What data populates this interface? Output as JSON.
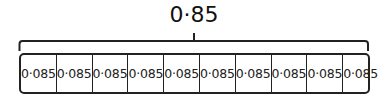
{
  "diagram": {
    "total": {
      "label": "0·85"
    },
    "parts": [
      {
        "label": "0·085"
      },
      {
        "label": "0·085"
      },
      {
        "label": "0·085"
      },
      {
        "label": "0·085"
      },
      {
        "label": "0·085"
      },
      {
        "label": "0·085"
      },
      {
        "label": "0·085"
      },
      {
        "label": "0·085"
      },
      {
        "label": "0·085"
      },
      {
        "label": "0·085"
      }
    ],
    "colors": {
      "stroke": "#222222",
      "background": "#ffffff"
    }
  }
}
